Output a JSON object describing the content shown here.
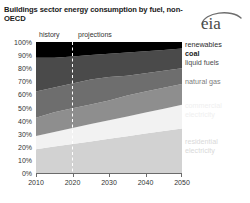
{
  "title": "Buildings sector energy consumption by fuel, non-OECD",
  "logo": {
    "text": "eia",
    "name": "eia-logo"
  },
  "periods": {
    "history": "history",
    "projections": "projections"
  },
  "legend": {
    "renewables": "renewables",
    "coal": "coal",
    "liquid_fuels": "liquid fuels",
    "natural_gas": "natural gas",
    "commercial_electricity": "commercial electricity",
    "residential_electricity": "residential electricity"
  },
  "axis": {
    "y_ticks": [
      "100%",
      "90%",
      "80%",
      "70%",
      "60%",
      "50%",
      "40%",
      "30%",
      "20%",
      "10%",
      "0%"
    ],
    "x_ticks": [
      "2010",
      "2020",
      "2030",
      "2040",
      "2050"
    ]
  },
  "colors": {
    "renewables": "#000000",
    "coal": "#4a4a4a",
    "liquid_fuels": "#6e6e6e",
    "natural_gas": "#8e8e8e",
    "commercial_electricity": "#f2f2f2",
    "residential_electricity": "#d2d2d2",
    "divider": "#ffffff",
    "axis": "#6b6b6b",
    "text": "#333333"
  },
  "chart_data": {
    "type": "area",
    "title": "Buildings sector energy consumption by fuel, non-OECD",
    "subtitle": "",
    "xlabel": "",
    "ylabel": "",
    "stacked": true,
    "normalized": true,
    "ylim": [
      0,
      100
    ],
    "xlim": [
      2010,
      2050
    ],
    "grid": false,
    "legend_position": "right",
    "history_end": 2020,
    "divider_label_left": "history",
    "divider_label_right": "projections",
    "x": [
      2010,
      2015,
      2020,
      2025,
      2030,
      2035,
      2040,
      2045,
      2050
    ],
    "series": [
      {
        "name": "residential electricity",
        "color": "#d2d2d2",
        "values": [
          18,
          20,
          22,
          24,
          26,
          28,
          30,
          32,
          34
        ]
      },
      {
        "name": "commercial electricity",
        "color": "#f2f2f2",
        "values": [
          10,
          11,
          12,
          13,
          14,
          15,
          16,
          17,
          18
        ]
      },
      {
        "name": "natural gas",
        "color": "#8e8e8e",
        "values": [
          14,
          14.5,
          15,
          15.5,
          16,
          16,
          16,
          16,
          16
        ]
      },
      {
        "name": "liquid fuels",
        "color": "#6e6e6e",
        "values": [
          20,
          19,
          18,
          17,
          16,
          15,
          14,
          13,
          12
        ]
      },
      {
        "name": "coal",
        "color": "#4a4a4a",
        "values": [
          26,
          24,
          22.5,
          21,
          19.5,
          18,
          17,
          16,
          15
        ]
      },
      {
        "name": "renewables",
        "color": "#000000",
        "values": [
          12,
          11.5,
          10.5,
          9.5,
          8.5,
          8,
          7,
          6,
          5
        ]
      }
    ],
    "axis_ranges": {
      "y": [
        0,
        100
      ],
      "y_step": 10,
      "x": [
        2010,
        2050
      ],
      "x_step": 10
    }
  }
}
